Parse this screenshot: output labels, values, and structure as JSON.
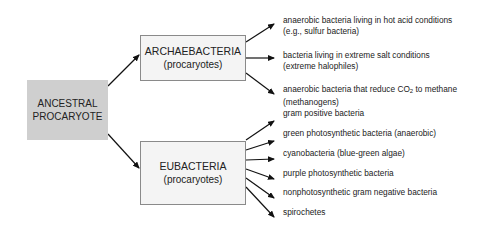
{
  "root": {
    "line1": "ANCESTRAL",
    "line2": "PROCARYOTE",
    "fill": "#cfcfcf"
  },
  "groups": [
    {
      "title": "ARCHAEBACTERIA",
      "subtitle": "(procaryotes)",
      "items": [
        {
          "line1": "anaerobic bacteria living in hot acid conditions",
          "line2": "(e.g., sulfur bacteria)"
        },
        {
          "line1": "bacteria living in extreme salt conditions",
          "line2": "(extreme halophiles)"
        },
        {
          "line1_pre": "anaerobic bacteria that reduce CO",
          "line1_sub": "2",
          "line1_post": " to methane",
          "line2": "(methanogens)"
        }
      ]
    },
    {
      "title": "EUBACTERIA",
      "subtitle": "(procaryotes)",
      "items": [
        {
          "line1": "gram positive bacteria"
        },
        {
          "line1": "green photosynthetic bacteria (anaerobic)"
        },
        {
          "line1": "cyanobacteria (blue-green algae)"
        },
        {
          "line1": "purple photosynthetic bacteria"
        },
        {
          "line1": "nonphotosynthetic gram negative bacteria"
        },
        {
          "line1": "spirochetes"
        }
      ]
    }
  ]
}
